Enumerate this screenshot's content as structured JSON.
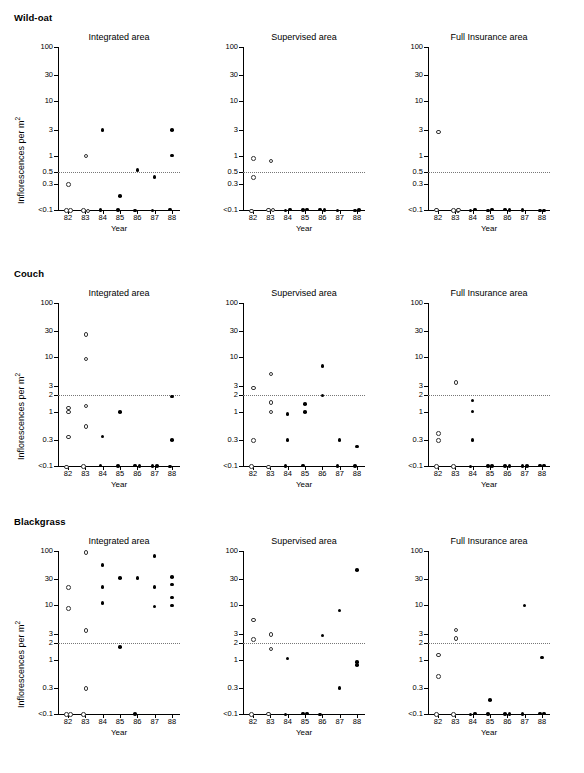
{
  "figure": {
    "ylabel": "Inflorescences per m",
    "ylabel_sup": "2",
    "xlabel": "Year",
    "open_marker_meaning": "open-circle",
    "closed_marker_meaning": "filled-circle",
    "threshold_line_style": "dotted"
  },
  "columns": [
    {
      "id": "integrated",
      "title": "Integrated area"
    },
    {
      "id": "supervised",
      "title": "Supervised area"
    },
    {
      "id": "insurance",
      "title": "Full Insurance area"
    }
  ],
  "xticks": [
    "82",
    "83",
    "84",
    "85",
    "86",
    "87",
    "88"
  ],
  "rows": [
    {
      "id": "wild-oat",
      "header": "Wild-oat",
      "yticks": [
        "100",
        "30",
        "10",
        "3",
        "1",
        "0.5",
        "0.3",
        "<0.1"
      ],
      "threshold_value": "0.5"
    },
    {
      "id": "couch",
      "header": "Couch",
      "yticks": [
        "100",
        "30",
        "10",
        "3",
        "2",
        "1",
        "0.3",
        "<0.1"
      ],
      "threshold_value": "2"
    },
    {
      "id": "blackgrass",
      "header": "Blackgrass",
      "yticks": [
        "100",
        "30",
        "10",
        "3",
        "2",
        "1",
        "0.3",
        "<0.1"
      ],
      "threshold_value": "2"
    }
  ],
  "chart_data": {
    "type": "scatter",
    "title": "",
    "xlabel": "Year",
    "ylabel": "Inflorescences per m2",
    "xlim": [
      81.5,
      88.5
    ],
    "ylim": [
      0.1,
      100
    ],
    "yscale": "log",
    "grid": false,
    "legend": "none",
    "panels": [
      {
        "row": "Wild-oat",
        "column": "Integrated area",
        "yticks": [
          100,
          30,
          10,
          3,
          1,
          0.5,
          0.3,
          0.1
        ],
        "ytick_labels": [
          "100",
          "30",
          "10",
          "3",
          "1",
          "0.5",
          "0.3",
          "<0.1"
        ],
        "threshold": 0.5,
        "series": [
          {
            "name": "open",
            "marker": "open-circle",
            "points": [
              [
                82,
                0.3
              ],
              [
                82,
                0.1
              ],
              [
                82,
                0.1
              ],
              [
                83,
                1
              ],
              [
                83,
                0.1
              ],
              [
                83,
                0.1
              ]
            ]
          },
          {
            "name": "closed",
            "marker": "filled-circle",
            "points": [
              [
                84,
                3
              ],
              [
                84,
                0.1
              ],
              [
                85,
                0.18
              ],
              [
                85,
                0.1
              ],
              [
                86,
                0.55
              ],
              [
                86,
                0.1
              ],
              [
                87,
                0.4
              ],
              [
                87,
                0.1
              ],
              [
                88,
                3
              ],
              [
                88,
                1
              ],
              [
                88,
                0.1
              ]
            ]
          }
        ]
      },
      {
        "row": "Wild-oat",
        "column": "Supervised area",
        "yticks": [
          100,
          30,
          10,
          3,
          1,
          0.5,
          0.3,
          0.1
        ],
        "ytick_labels": [
          "100",
          "30",
          "10",
          "3",
          "1",
          "0.5",
          "0.3",
          "<0.1"
        ],
        "threshold": 0.5,
        "series": [
          {
            "name": "open",
            "marker": "open-circle",
            "points": [
              [
                82,
                0.9
              ],
              [
                82,
                0.4
              ],
              [
                82,
                0.1
              ],
              [
                83,
                0.82
              ],
              [
                83,
                0.1
              ],
              [
                83,
                0.1
              ]
            ]
          },
          {
            "name": "closed",
            "marker": "filled-circle",
            "points": [
              [
                84,
                0.1
              ],
              [
                84,
                0.1
              ],
              [
                85,
                0.1
              ],
              [
                85,
                0.1
              ],
              [
                86,
                0.1
              ],
              [
                86,
                0.1
              ],
              [
                87,
                0.1
              ],
              [
                88,
                0.1
              ],
              [
                88,
                0.1
              ]
            ]
          }
        ]
      },
      {
        "row": "Wild-oat",
        "column": "Full Insurance area",
        "yticks": [
          100,
          30,
          10,
          3,
          1,
          0.5,
          0.3,
          0.1
        ],
        "ytick_labels": [
          "100",
          "30",
          "10",
          "3",
          "1",
          "0.5",
          "0.3",
          "<0.1"
        ],
        "threshold": 0.5,
        "series": [
          {
            "name": "open",
            "marker": "open-circle",
            "points": [
              [
                82,
                2.8
              ],
              [
                82,
                0.1
              ],
              [
                83,
                0.1
              ],
              [
                83,
                0.1
              ],
              [
                83,
                0.1
              ]
            ]
          },
          {
            "name": "closed",
            "marker": "filled-circle",
            "points": [
              [
                84,
                0.1
              ],
              [
                84,
                0.1
              ],
              [
                85,
                0.1
              ],
              [
                85,
                0.1
              ],
              [
                86,
                0.1
              ],
              [
                86,
                0.1
              ],
              [
                87,
                0.1
              ],
              [
                88,
                0.1
              ],
              [
                88,
                0.1
              ]
            ]
          }
        ]
      },
      {
        "row": "Couch",
        "column": "Integrated area",
        "yticks": [
          100,
          30,
          10,
          3,
          2,
          1,
          0.3,
          0.1
        ],
        "ytick_labels": [
          "100",
          "30",
          "10",
          "3",
          "2",
          "1",
          "0.3",
          "<0.1"
        ],
        "threshold": 2,
        "series": [
          {
            "name": "open",
            "marker": "open-circle",
            "points": [
              [
                82,
                1.2
              ],
              [
                82,
                1.0
              ],
              [
                82,
                0.35
              ],
              [
                82,
                0.1
              ],
              [
                83,
                27
              ],
              [
                83,
                9.5
              ],
              [
                83,
                1.3
              ],
              [
                83,
                0.55
              ],
              [
                83,
                0.1
              ]
            ]
          },
          {
            "name": "closed",
            "marker": "filled-circle",
            "points": [
              [
                84,
                0.35
              ],
              [
                84,
                0.1
              ],
              [
                85,
                0.98
              ],
              [
                85,
                0.1
              ],
              [
                86,
                0.1
              ],
              [
                86,
                0.1
              ],
              [
                87,
                0.1
              ],
              [
                87,
                0.1
              ],
              [
                88,
                1.9
              ],
              [
                88,
                0.3
              ],
              [
                88,
                0.1
              ]
            ]
          }
        ]
      },
      {
        "row": "Couch",
        "column": "Supervised area",
        "yticks": [
          100,
          30,
          10,
          3,
          2,
          1,
          0.3,
          0.1
        ],
        "ytick_labels": [
          "100",
          "30",
          "10",
          "3",
          "2",
          "1",
          "0.3",
          "<0.1"
        ],
        "threshold": 2,
        "series": [
          {
            "name": "open",
            "marker": "open-circle",
            "points": [
              [
                82,
                2.8
              ],
              [
                82,
                0.3
              ],
              [
                82,
                0.1
              ],
              [
                83,
                5.0
              ],
              [
                83,
                1.5
              ],
              [
                83,
                1.0
              ],
              [
                83,
                0.1
              ]
            ]
          },
          {
            "name": "closed",
            "marker": "filled-circle",
            "points": [
              [
                84,
                0.9
              ],
              [
                84,
                0.3
              ],
              [
                84,
                0.1
              ],
              [
                85,
                1.4
              ],
              [
                85,
                0.98
              ],
              [
                85,
                0.1
              ],
              [
                86,
                7.0
              ],
              [
                86,
                2.0
              ],
              [
                87,
                0.3
              ],
              [
                87,
                0.1
              ],
              [
                88,
                0.23
              ],
              [
                88,
                0.1
              ]
            ]
          }
        ]
      },
      {
        "row": "Couch",
        "column": "Full Insurance area",
        "yticks": [
          100,
          30,
          10,
          3,
          2,
          1,
          0.3,
          0.1
        ],
        "ytick_labels": [
          "100",
          "30",
          "10",
          "3",
          "2",
          "1",
          "0.3",
          "<0.1"
        ],
        "threshold": 2,
        "series": [
          {
            "name": "open",
            "marker": "open-circle",
            "points": [
              [
                82,
                0.4
              ],
              [
                82,
                0.3
              ],
              [
                82,
                0.1
              ],
              [
                83,
                3.5
              ],
              [
                83,
                0.1
              ]
            ]
          },
          {
            "name": "closed",
            "marker": "filled-circle",
            "points": [
              [
                84,
                1.6
              ],
              [
                84,
                1.0
              ],
              [
                84,
                0.3
              ],
              [
                84,
                0.1
              ],
              [
                85,
                0.1
              ],
              [
                85,
                0.1
              ],
              [
                86,
                0.1
              ],
              [
                86,
                0.1
              ],
              [
                87,
                0.1
              ],
              [
                87,
                0.1
              ],
              [
                88,
                0.1
              ],
              [
                88,
                0.1
              ]
            ]
          }
        ]
      },
      {
        "row": "Blackgrass",
        "column": "Integrated area",
        "yticks": [
          100,
          30,
          10,
          3,
          2,
          1,
          0.3,
          0.1
        ],
        "ytick_labels": [
          "100",
          "30",
          "10",
          "3",
          "2",
          "1",
          "0.3",
          "<0.1"
        ],
        "threshold": 2,
        "series": [
          {
            "name": "open",
            "marker": "open-circle",
            "points": [
              [
                82,
                22
              ],
              [
                82,
                9.0
              ],
              [
                82,
                0.1
              ],
              [
                82,
                0.1
              ],
              [
                83,
                95
              ],
              [
                83,
                3.5
              ],
              [
                83,
                0.3
              ],
              [
                83,
                0.1
              ]
            ]
          },
          {
            "name": "closed",
            "marker": "filled-circle",
            "points": [
              [
                84,
                55
              ],
              [
                84,
                22
              ],
              [
                84,
                11
              ],
              [
                85,
                32
              ],
              [
                85,
                1.7
              ],
              [
                86,
                32
              ],
              [
                86,
                0.1
              ],
              [
                87,
                80
              ],
              [
                87,
                22
              ],
              [
                87,
                9.5
              ],
              [
                88,
                33
              ],
              [
                88,
                24
              ],
              [
                88,
                14
              ],
              [
                88,
                10
              ]
            ]
          }
        ]
      },
      {
        "row": "Blackgrass",
        "column": "Supervised area",
        "yticks": [
          100,
          30,
          10,
          3,
          2,
          1,
          0.3,
          0.1
        ],
        "ytick_labels": [
          "100",
          "30",
          "10",
          "3",
          "2",
          "1",
          "0.3",
          "<0.1"
        ],
        "threshold": 2,
        "series": [
          {
            "name": "open",
            "marker": "open-circle",
            "points": [
              [
                82,
                5.5
              ],
              [
                82,
                2.4
              ],
              [
                82,
                0.1
              ],
              [
                83,
                3.0
              ],
              [
                83,
                1.6
              ],
              [
                83,
                0.1
              ]
            ]
          },
          {
            "name": "closed",
            "marker": "filled-circle",
            "points": [
              [
                84,
                1.05
              ],
              [
                84,
                0.1
              ],
              [
                85,
                0.1
              ],
              [
                85,
                0.1
              ],
              [
                86,
                2.8
              ],
              [
                86,
                0.1
              ],
              [
                87,
                8.0
              ],
              [
                87,
                0.3
              ],
              [
                88,
                45
              ],
              [
                88,
                0.9
              ],
              [
                88,
                0.8
              ]
            ]
          }
        ]
      },
      {
        "row": "Blackgrass",
        "column": "Full Insurance area",
        "yticks": [
          100,
          30,
          10,
          3,
          2,
          1,
          0.3,
          0.1
        ],
        "ytick_labels": [
          "100",
          "30",
          "10",
          "3",
          "2",
          "1",
          "0.3",
          "<0.1"
        ],
        "threshold": 2,
        "series": [
          {
            "name": "open",
            "marker": "open-circle",
            "points": [
              [
                82,
                1.25
              ],
              [
                82,
                0.5
              ],
              [
                82,
                0.1
              ],
              [
                83,
                3.6
              ],
              [
                83,
                2.5
              ],
              [
                83,
                0.1
              ]
            ]
          },
          {
            "name": "closed",
            "marker": "filled-circle",
            "points": [
              [
                84,
                0.1
              ],
              [
                84,
                0.1
              ],
              [
                85,
                0.18
              ],
              [
                85,
                0.1
              ],
              [
                86,
                0.1
              ],
              [
                86,
                0.1
              ],
              [
                87,
                10
              ],
              [
                87,
                0.1
              ],
              [
                88,
                1.1
              ],
              [
                88,
                0.1
              ],
              [
                88,
                0.1
              ]
            ]
          }
        ]
      }
    ]
  }
}
